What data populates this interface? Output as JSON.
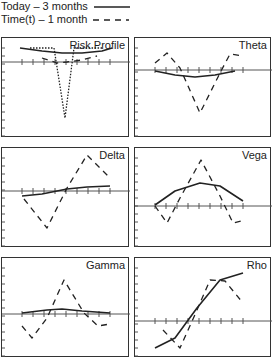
{
  "legend": [
    {
      "label": "Today – 3 months",
      "style": "solid"
    },
    {
      "label": "Time(t) – 1 month",
      "style": "dashed"
    }
  ],
  "chart_data": [
    {
      "type": "line",
      "title": "Risk Profile",
      "series": [
        {
          "name": "Today – 3 months",
          "style": "solid",
          "points": [
            [
              18,
              10
            ],
            [
              40,
              13
            ],
            [
              60,
              15
            ],
            [
              80,
              15
            ],
            [
              100,
              13
            ],
            [
              110,
              10
            ]
          ]
        },
        {
          "name": "Time(t) – 1 month",
          "style": "dashed",
          "points": [
            [
              40,
              20
            ],
            [
              55,
              25
            ],
            [
              65,
              24
            ],
            [
              80,
              22
            ],
            [
              95,
              18
            ]
          ]
        },
        {
          "name": "Expiry",
          "style": "dotted",
          "points": [
            [
              28,
              10
            ],
            [
              52,
              10
            ],
            [
              63,
              80
            ],
            [
              72,
              10
            ],
            [
              100,
              10
            ]
          ]
        }
      ]
    },
    {
      "type": "line",
      "title": "Theta",
      "series": [
        {
          "name": "Today – 3 months",
          "style": "solid",
          "points": [
            [
              20,
              33
            ],
            [
              40,
              37
            ],
            [
              60,
              39
            ],
            [
              80,
              37
            ],
            [
              100,
              33
            ]
          ]
        },
        {
          "name": "Time(t) – 1 month",
          "style": "dashed",
          "points": [
            [
              20,
              25
            ],
            [
              32,
              15
            ],
            [
              45,
              30
            ],
            [
              65,
              75
            ],
            [
              85,
              35
            ],
            [
              95,
              16
            ],
            [
              108,
              18
            ]
          ]
        }
      ]
    },
    {
      "type": "line",
      "title": "Delta",
      "series": [
        {
          "name": "Today – 3 months",
          "style": "solid",
          "points": [
            [
              20,
              48
            ],
            [
              40,
              46
            ],
            [
              65,
              41
            ],
            [
              85,
              39
            ],
            [
              108,
              38
            ]
          ]
        },
        {
          "name": "Time(t) – 1 month",
          "style": "dashed",
          "points": [
            [
              22,
              51
            ],
            [
              45,
              80
            ],
            [
              65,
              40
            ],
            [
              85,
              7
            ],
            [
              108,
              30
            ]
          ]
        }
      ]
    },
    {
      "type": "line",
      "title": "Vega",
      "series": [
        {
          "name": "Today – 3 months",
          "style": "solid",
          "points": [
            [
              20,
              57
            ],
            [
              40,
              43
            ],
            [
              65,
              35
            ],
            [
              85,
              38
            ],
            [
              108,
              53
            ]
          ]
        },
        {
          "name": "Time(t) – 1 month",
          "style": "dashed",
          "points": [
            [
              20,
              58
            ],
            [
              32,
              75
            ],
            [
              45,
              50
            ],
            [
              66,
              12
            ],
            [
              85,
              48
            ],
            [
              98,
              75
            ],
            [
              110,
              72
            ]
          ]
        }
      ]
    },
    {
      "type": "line",
      "title": "Gamma",
      "series": [
        {
          "name": "Today – 3 months",
          "style": "solid",
          "points": [
            [
              20,
              55
            ],
            [
              45,
              52
            ],
            [
              60,
              51
            ],
            [
              80,
              53
            ],
            [
              108,
              55
            ]
          ]
        },
        {
          "name": "Time(t) – 1 month",
          "style": "dashed",
          "points": [
            [
              20,
              68
            ],
            [
              30,
              80
            ],
            [
              45,
              60
            ],
            [
              62,
              22
            ],
            [
              82,
              55
            ],
            [
              96,
              68
            ],
            [
              108,
              66
            ]
          ]
        }
      ]
    },
    {
      "type": "line",
      "title": "Rho",
      "series": [
        {
          "name": "Today – 3 months",
          "style": "solid",
          "points": [
            [
              20,
              90
            ],
            [
              40,
              80
            ],
            [
              62,
              50
            ],
            [
              85,
              22
            ],
            [
              108,
              15
            ]
          ]
        },
        {
          "name": "Time(t) – 1 month",
          "style": "dashed",
          "points": [
            [
              28,
              72
            ],
            [
              45,
              90
            ],
            [
              62,
              52
            ],
            [
              75,
              22
            ],
            [
              90,
              23
            ],
            [
              108,
              45
            ]
          ]
        }
      ]
    }
  ]
}
